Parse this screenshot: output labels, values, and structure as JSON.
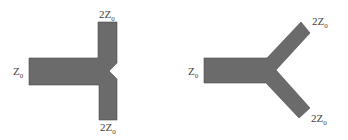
{
  "diagrams": {
    "t_junction": {
      "input_label": {
        "main": "Z",
        "sub": "0"
      },
      "top_label": {
        "main": "2Z",
        "sub": "0"
      },
      "bottom_label": {
        "main": "2Z",
        "sub": "0"
      }
    },
    "y_junction": {
      "input_label": {
        "main": "Z",
        "sub": "0"
      },
      "top_label": {
        "main": "2Z",
        "sub": "0"
      },
      "bottom_label": {
        "main": "2Z",
        "sub": "0"
      }
    }
  },
  "colors": {
    "trace_fill": "#6b6b6b",
    "trace_edge": "#4a4a4a",
    "label": "#444444",
    "background": "#ffffff"
  }
}
